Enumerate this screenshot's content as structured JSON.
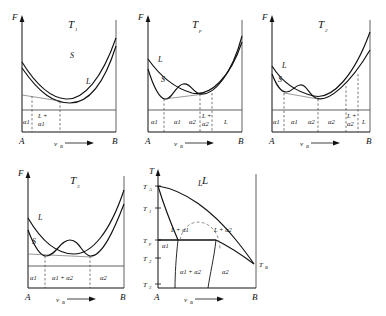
{
  "figure": {
    "kind": "free-energy-composition and temperature-composition diagrams",
    "axis_labels": {
      "free_energy": "F",
      "temperature": "T",
      "composition": "v",
      "composition_sub": "B",
      "left_component": "A",
      "right_component": "B"
    },
    "phase_labels": {
      "liquid": "L",
      "solid": "S",
      "alpha1": "α1",
      "alpha2": "α2"
    }
  },
  "panels": [
    {
      "id": "panel-T1",
      "title": "T",
      "title_sub": "1",
      "type": "free-energy",
      "ylabel": "F",
      "xlabel": "v",
      "xlabel_sub": "B",
      "left_end": "A",
      "right_end": "B",
      "curve_labels": [
        {
          "text": "S",
          "x": 62,
          "y": 52
        },
        {
          "text": "L",
          "x": 78,
          "y": 78
        }
      ],
      "regions": [
        {
          "text": "α",
          "sub": "1",
          "stacked": false,
          "x": 17,
          "y": 106
        },
        {
          "text": "L +",
          "sub2": "α1",
          "stacked": true,
          "x": 34,
          "y": 99
        }
      ],
      "boundaries": [
        14,
        28,
        50
      ]
    },
    {
      "id": "panel-Tp",
      "title": "T",
      "title_sub": "p",
      "type": "free-energy",
      "ylabel": "F",
      "xlabel": "v",
      "xlabel_sub": "B",
      "left_end": "A",
      "right_end": "B",
      "curve_labels": [
        {
          "text": "L",
          "x": 22,
          "y": 52
        },
        {
          "text": "S",
          "x": 25,
          "y": 72
        }
      ],
      "regions": [
        {
          "text": "α1",
          "x": 10,
          "y": 106
        },
        {
          "text": "α1",
          "x": 33,
          "y": 106
        },
        {
          "text": "α2",
          "x": 56,
          "y": 106
        },
        {
          "text": "L +",
          "sub2": "α2",
          "stacked": true,
          "x": 72,
          "y": 99
        },
        {
          "text": "L",
          "x": 90,
          "y": 106
        }
      ],
      "boundaries": [
        20,
        46,
        66,
        80
      ]
    },
    {
      "id": "panel-T2",
      "title": "T",
      "title_sub": "2",
      "type": "free-energy",
      "ylabel": "F",
      "xlabel": "v",
      "xlabel_sub": "B",
      "left_end": "A",
      "right_end": "B",
      "curve_labels": [
        {
          "text": "L",
          "x": 22,
          "y": 58
        },
        {
          "text": "S",
          "x": 18,
          "y": 72
        }
      ],
      "regions": [
        {
          "text": "α1",
          "x": 8,
          "y": 106
        },
        {
          "text": "α1",
          "x": 26,
          "y": 106
        },
        {
          "text": "α2",
          "x": 46,
          "y": 106
        },
        {
          "text": "α2",
          "x": 68,
          "y": 106
        },
        {
          "text": "L +",
          "sub2": "α2",
          "stacked": true,
          "x": 85,
          "y": 99
        },
        {
          "text": "L",
          "x": 99,
          "y": 106
        }
      ],
      "boundaries": [
        16,
        36,
        58,
        80,
        92
      ]
    },
    {
      "id": "panel-T3",
      "title": "T",
      "title_sub": "3",
      "type": "free-energy",
      "ylabel": "F",
      "xlabel": "v",
      "xlabel_sub": "B",
      "left_end": "A",
      "right_end": "B",
      "curve_labels": [
        {
          "text": "L",
          "x": 22,
          "y": 54
        },
        {
          "text": "S",
          "x": 14,
          "y": 80
        }
      ],
      "regions": [
        {
          "text": "α1",
          "x": 10,
          "y": 106
        },
        {
          "text": "α1 + α2",
          "x": 40,
          "y": 106
        },
        {
          "text": "α2",
          "x": 82,
          "y": 106
        }
      ],
      "boundaries": [
        22,
        66
      ]
    },
    {
      "id": "panel-phase",
      "title": "L",
      "type": "phase-diagram",
      "ylabel": "T",
      "xlabel": "v",
      "xlabel_sub": "B",
      "left_end": "A",
      "right_end": "B",
      "y_ticks": [
        {
          "label": "T",
          "sub": "A",
          "y": 12
        },
        {
          "label": "T",
          "sub": "1",
          "y": 38
        },
        {
          "label": "T",
          "sub": "p",
          "y": 72
        },
        {
          "label": "T",
          "sub": "2",
          "y": 90
        },
        {
          "label": "T",
          "sub": "3",
          "y": 112
        }
      ],
      "right_tick": {
        "label": "T",
        "sub": "B",
        "y": 98
      },
      "field_labels": [
        {
          "text": "L",
          "x": 58,
          "y": 14
        },
        {
          "text": "L + α1",
          "x": 36,
          "y": 62
        },
        {
          "text": "L + α2",
          "x": 76,
          "y": 62
        },
        {
          "text": "α1",
          "x": 15,
          "y": 76
        },
        {
          "text": "α1 + α2",
          "x": 42,
          "y": 108
        },
        {
          "text": "α2",
          "x": 83,
          "y": 108
        }
      ]
    }
  ]
}
